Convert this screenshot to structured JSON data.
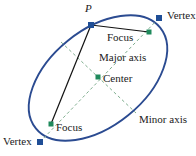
{
  "figure": {
    "colors": {
      "ellipse_stroke": "#2b4b91",
      "vertex_marker": "#1f4e96",
      "focus_marker": "#1f8a5c",
      "axis_dash": "#7fae8f",
      "chord_line": "#111111",
      "label_text": "#1a1a1a"
    },
    "labels": [
      {
        "id": "point-p",
        "text": "P",
        "x": 85,
        "y": 3,
        "style": "italic"
      },
      {
        "id": "vertex-top-right",
        "text": "Vertex",
        "x": 167,
        "y": 10,
        "style": "normal"
      },
      {
        "id": "focus-upper",
        "text": "Focus",
        "x": 107,
        "y": 32,
        "style": "normal"
      },
      {
        "id": "major-axis",
        "text": "Major axis",
        "x": 99,
        "y": 52,
        "style": "normal"
      },
      {
        "id": "center",
        "text": "Center",
        "x": 103,
        "y": 73,
        "style": "normal"
      },
      {
        "id": "minor-axis",
        "text": "Minor axis",
        "x": 139,
        "y": 114,
        "style": "normal"
      },
      {
        "id": "focus-lower",
        "text": "Focus",
        "x": 56,
        "y": 122,
        "style": "normal"
      },
      {
        "id": "vertex-bottom-left",
        "text": "Vertex",
        "x": 3,
        "y": 136,
        "style": "normal"
      }
    ],
    "points": [
      {
        "id": "point-p-marker",
        "kind": "square",
        "x": 91,
        "y": 25
      },
      {
        "id": "vertex-top-right-marker",
        "kind": "square",
        "x": 159,
        "y": 18
      },
      {
        "id": "focus-upper-marker",
        "kind": "square",
        "x": 149,
        "y": 32
      },
      {
        "id": "center-marker",
        "kind": "square",
        "x": 98,
        "y": 77
      },
      {
        "id": "focus-lower-marker",
        "kind": "square",
        "x": 51,
        "y": 124
      },
      {
        "id": "vertex-bottom-left-marker",
        "kind": "square",
        "x": 40,
        "y": 142
      }
    ],
    "ellipse": {
      "cx": 98,
      "cy": 78,
      "rx": 80,
      "ry": 48,
      "rotation_deg": -39
    },
    "lines": {
      "major_axis": {
        "x1": 40,
        "y1": 142,
        "x2": 159,
        "y2": 18,
        "dashed": true
      },
      "minor_axis": {
        "x1": 61,
        "y1": 42,
        "x2": 136,
        "y2": 113,
        "dashed": true
      },
      "chord_p_to_focus_upper": {
        "x1": 91,
        "y1": 25,
        "x2": 149,
        "y2": 32,
        "dashed": false
      },
      "chord_p_to_focus_lower": {
        "x1": 91,
        "y1": 25,
        "x2": 51,
        "y2": 124,
        "dashed": false
      }
    }
  }
}
